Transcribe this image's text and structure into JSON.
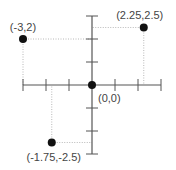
{
  "chart_data": {
    "type": "scatter",
    "title": "",
    "xlabel": "",
    "ylabel": "",
    "xlim": [
      -3,
      3
    ],
    "ylim": [
      -3,
      3
    ],
    "x_ticks": [
      -3,
      -2,
      -1,
      0,
      1,
      2,
      3
    ],
    "y_ticks": [
      -3,
      -2,
      -1,
      0,
      1,
      2,
      3
    ],
    "grid": false,
    "legend": null,
    "points": [
      {
        "x": -3,
        "y": 2,
        "label": "(-3,2)"
      },
      {
        "x": 2.25,
        "y": 2.5,
        "label": "(2.25,2.5)"
      },
      {
        "x": 0,
        "y": 0,
        "label": "(0,0)"
      },
      {
        "x": -1.75,
        "y": -2.5,
        "label": "(-1.75,-2.5)"
      }
    ],
    "guides": "dotted projection lines from each non-origin point to both axes"
  },
  "colors": {
    "axis": "#555555",
    "guide": "#b8b8b8",
    "point": "#111111",
    "label": "#444444"
  }
}
